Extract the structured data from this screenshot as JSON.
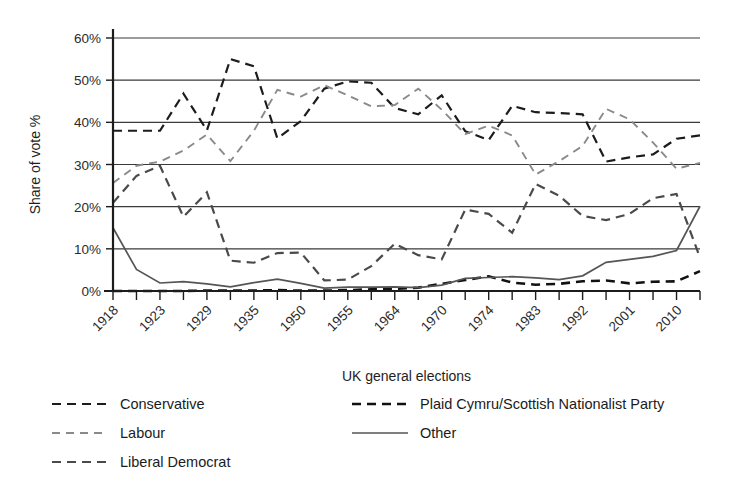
{
  "chart_data": {
    "type": "line",
    "title": "",
    "xlabel": "UK general elections",
    "ylabel": "Share of vote %",
    "ylim": [
      0,
      60
    ],
    "yticks": [
      0,
      10,
      20,
      30,
      40,
      50,
      60
    ],
    "ytick_labels": [
      "0%",
      "10%",
      "20%",
      "30%",
      "40%",
      "50%",
      "60%"
    ],
    "grid": true,
    "legend_position": "below",
    "x": [
      "1918",
      "1922",
      "1923",
      "1924",
      "1929",
      "1931",
      "1935",
      "1945",
      "1950",
      "1951",
      "1955",
      "1959",
      "1964",
      "1966",
      "1970",
      "1974F",
      "1974O",
      "1979",
      "1983",
      "1987",
      "1992",
      "1997",
      "2001",
      "2005",
      "2010",
      "2015"
    ],
    "xtick_labels_shown": [
      "1918",
      "1923",
      "1929",
      "1935",
      "1950",
      "1955",
      "1964",
      "1970",
      "1974",
      "1983",
      "1992",
      "2001",
      "2010"
    ],
    "xtick_label_indices": [
      0,
      2,
      4,
      6,
      8,
      10,
      12,
      14,
      16,
      18,
      20,
      22,
      24
    ],
    "series": [
      {
        "name": "Conservative",
        "style": "dashed",
        "color": "#1c1c1c",
        "values": [
          38,
          38,
          38,
          46.8,
          38.1,
          55,
          53.3,
          36.2,
          40.3,
          48,
          49.7,
          49.4,
          43.4,
          41.9,
          46.4,
          37.9,
          35.8,
          43.9,
          42.4,
          42.2,
          41.9,
          30.7,
          31.7,
          32.4,
          36.1,
          36.9
        ]
      },
      {
        "name": "Labour",
        "style": "dashed-light",
        "color": "#8a8a8a",
        "values": [
          25.6,
          29.7,
          30.7,
          33.3,
          37.1,
          30.8,
          38,
          47.7,
          46.1,
          48.8,
          46.4,
          43.8,
          44.1,
          48,
          43,
          37.2,
          39.2,
          36.9,
          27.6,
          30.8,
          34.4,
          43.2,
          40.7,
          35.2,
          29,
          30.4
        ]
      },
      {
        "name": "Liberal Democrat",
        "style": "dashed",
        "color": "#4a4a4a",
        "values": [
          20.9,
          27.3,
          29.7,
          17.6,
          23.4,
          7.2,
          6.7,
          9,
          9.1,
          2.5,
          2.7,
          5.9,
          11.2,
          8.5,
          7.5,
          19.3,
          18.3,
          13.8,
          25.4,
          22.6,
          17.8,
          16.8,
          18.3,
          22,
          23,
          7.9
        ]
      },
      {
        "name": "Plaid Cymru/Scottish Nationalist Party",
        "style": "dashed-bold",
        "color": "#111111",
        "values": [
          0,
          0,
          0,
          0,
          0.1,
          0.1,
          0.1,
          0.2,
          0.1,
          0.1,
          0.2,
          0.4,
          0.5,
          0.8,
          1.7,
          2.6,
          3.5,
          2.0,
          1.5,
          1.7,
          2.3,
          2.5,
          1.8,
          2.2,
          2.3,
          4.7
        ]
      },
      {
        "name": "Other",
        "style": "solid",
        "color": "#555555",
        "values": [
          15.0,
          5.1,
          1.9,
          2.2,
          1.7,
          1.0,
          2.0,
          2.8,
          1.8,
          0.7,
          0.9,
          0.9,
          1.0,
          0.8,
          1.4,
          3.0,
          3.2,
          3.4,
          3.1,
          2.7,
          3.6,
          6.8,
          7.5,
          8.2,
          9.6,
          20.1
        ]
      }
    ]
  },
  "legend": {
    "columns": [
      [
        {
          "label": "Conservative",
          "style": "dashed",
          "color": "#1c1c1c"
        },
        {
          "label": "Labour",
          "style": "dashed-light",
          "color": "#8a8a8a"
        },
        {
          "label": "Liberal Democrat",
          "style": "dashed",
          "color": "#4a4a4a"
        }
      ],
      [
        {
          "label": "Plaid Cymru/Scottish Nationalist Party",
          "style": "dashed-bold",
          "color": "#111111"
        },
        {
          "label": "Other",
          "style": "solid",
          "color": "#555555"
        }
      ]
    ]
  }
}
